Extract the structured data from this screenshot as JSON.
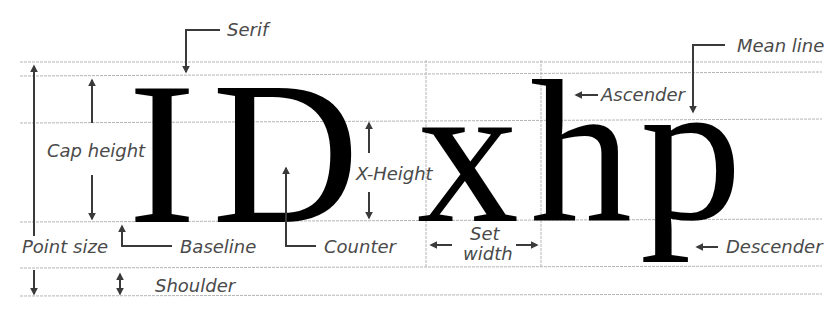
{
  "diagram": {
    "specimen_glyphs": [
      "I",
      "D",
      "x",
      "h",
      "p"
    ],
    "colors": {
      "glyph": "#000000",
      "label": "#4a4a4a",
      "arrow": "#3a3a3a",
      "guide_line": "#b5b5b5"
    },
    "labels": {
      "serif": "Serif",
      "mean_line": "Mean line",
      "ascender": "Ascender",
      "cap_height": "Cap height",
      "x_height": "X-Height",
      "point_size": "Point size",
      "baseline": "Baseline",
      "counter": "Counter",
      "set_width_line1": "Set",
      "set_width_line2": "width",
      "descender": "Descender",
      "shoulder": "Shoulder"
    }
  }
}
